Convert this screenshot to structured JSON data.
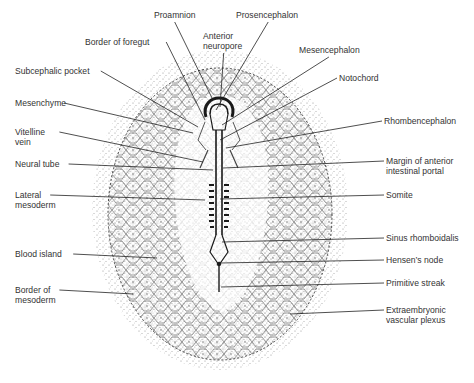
{
  "figure": {
    "labels": [
      {
        "id": "proamnion",
        "text": "Proamnion",
        "x": 154,
        "y": 15,
        "ax": 213,
        "ay": 100
      },
      {
        "id": "prosencephalon",
        "text": "Prosencephalon",
        "x": 236,
        "y": 15,
        "ax": 216,
        "ay": 110
      },
      {
        "id": "anterior-neuropore",
        "text": "Anterior\nneuropore",
        "x": 203,
        "y": 36,
        "ax": 220,
        "ay": 107
      },
      {
        "id": "border-of-foregut",
        "text": "Border of foregut",
        "x": 85,
        "y": 42,
        "ax": 205,
        "ay": 120
      },
      {
        "id": "mesencephalon",
        "text": "Mesencephalon",
        "x": 299,
        "y": 50,
        "ax": 222,
        "ay": 125
      },
      {
        "id": "subcephalic-pocket",
        "text": "Subcephalic pocket",
        "x": 15,
        "y": 71,
        "ax": 198,
        "ay": 127
      },
      {
        "id": "notochord",
        "text": "Notochord",
        "x": 339,
        "y": 78,
        "ax": 220,
        "ay": 140
      },
      {
        "id": "mesenchyme",
        "text": "Mesenchyme",
        "x": 15,
        "y": 103,
        "ax": 193,
        "ay": 133
      },
      {
        "id": "rhombencephalon",
        "text": "Rhombencephalon",
        "x": 384,
        "y": 121,
        "ax": 226,
        "ay": 148
      },
      {
        "id": "vitelline-vein",
        "text": "Vitelline\nvein",
        "x": 15,
        "y": 132,
        "ax": 203,
        "ay": 162
      },
      {
        "id": "neural-tube",
        "text": "Neural tube",
        "x": 15,
        "y": 164,
        "ax": 213,
        "ay": 170
      },
      {
        "id": "margin-anterior-intestinal-portal",
        "text": "Margin of anterior\nintestinal portal",
        "x": 386,
        "y": 161,
        "ax": 223,
        "ay": 168
      },
      {
        "id": "lateral-mesoderm",
        "text": "Lateral\nmesoderm",
        "x": 15,
        "y": 195,
        "ax": 205,
        "ay": 200
      },
      {
        "id": "somite",
        "text": "Somite",
        "x": 386,
        "y": 195,
        "ax": 220,
        "ay": 199
      },
      {
        "id": "sinus-rhomboidalis",
        "text": "Sinus rhomboidalis",
        "x": 386,
        "y": 238,
        "ax": 222,
        "ay": 242
      },
      {
        "id": "blood-island",
        "text": "Blood island",
        "x": 15,
        "y": 254,
        "ax": 157,
        "ay": 258
      },
      {
        "id": "hensens-node",
        "text": "Hensen’s node",
        "x": 386,
        "y": 260,
        "ax": 220,
        "ay": 263
      },
      {
        "id": "border-of-mesoderm",
        "text": "Border of\nmesoderm",
        "x": 15,
        "y": 290,
        "ax": 133,
        "ay": 294
      },
      {
        "id": "primitive-streak",
        "text": "Primitive streak",
        "x": 386,
        "y": 283,
        "ax": 221,
        "ay": 287
      },
      {
        "id": "extraembryonic-vascular-plexus",
        "text": "Extraembryonic\nvascular plexus",
        "x": 386,
        "y": 310,
        "ax": 290,
        "ay": 314
      }
    ],
    "colors": {
      "ink": "#2a2a2a",
      "stipple": "#555555",
      "background": "#ffffff"
    }
  }
}
